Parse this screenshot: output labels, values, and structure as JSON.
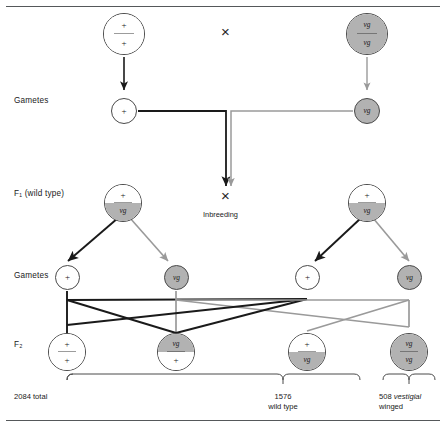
{
  "figure": {
    "title_rules": {
      "top": true,
      "bottom": true
    },
    "colors": {
      "shaded_allele_fill": "#b2b2b2",
      "outline": "#4a4a4a",
      "dominant_line": "#1a1a1a",
      "recessive_line": "#9a9a9a",
      "text": "#1a1a1a"
    }
  },
  "row_labels": {
    "gametes_upper": "Gametes",
    "f1": "F₁ (wild type)",
    "gametes_lower": "Gametes",
    "f2": "F₂"
  },
  "alleles": {
    "wild_type": "+",
    "vestigial": "vg"
  },
  "parents": {
    "cross_symbol": "×",
    "left": {
      "name": "wild-type-parent",
      "top": "+",
      "bottom": "+",
      "top_shaded": false,
      "bottom_shaded": false
    },
    "right": {
      "name": "vestigial-parent",
      "top": "vg",
      "bottom": "vg",
      "top_shaded": true,
      "bottom_shaded": true
    }
  },
  "gametes_upper": [
    {
      "name": "gamete-plus-left",
      "label": "+",
      "shaded": false
    },
    {
      "name": "gamete-vg-right",
      "label": "vg",
      "shaded": true
    }
  ],
  "f1": {
    "cross_symbol": "×",
    "inbreeding_label": "Inbreeding",
    "left": {
      "name": "f1-heterozygote-left",
      "top": "+",
      "bottom": "vg",
      "top_shaded": false,
      "bottom_shaded": true
    },
    "right": {
      "name": "f1-heterozygote-right",
      "top": "+",
      "bottom": "vg",
      "top_shaded": false,
      "bottom_shaded": true
    }
  },
  "gametes_lower": [
    {
      "name": "f1-gamete-plus-left",
      "label": "+",
      "shaded": false
    },
    {
      "name": "f1-gamete-vg-left",
      "label": "vg",
      "shaded": true
    },
    {
      "name": "f1-gamete-plus-right",
      "label": "+",
      "shaded": false
    },
    {
      "name": "f1-gamete-vg-right",
      "label": "vg",
      "shaded": true
    }
  ],
  "f2": [
    {
      "name": "f2-genotype-1",
      "top": "+",
      "bottom": "+",
      "top_shaded": false,
      "bottom_shaded": false
    },
    {
      "name": "f2-genotype-2",
      "top": "vg",
      "bottom": "+",
      "top_shaded": true,
      "bottom_shaded": false
    },
    {
      "name": "f2-genotype-3",
      "top": "+",
      "bottom": "vg",
      "top_shaded": false,
      "bottom_shaded": true
    },
    {
      "name": "f2-genotype-4",
      "top": "vg",
      "bottom": "vg",
      "top_shaded": true,
      "bottom_shaded": true
    }
  ],
  "counts": {
    "total": "2084 total",
    "wild_type_number": "1576",
    "wild_type_text": "wild type",
    "vestigial_number": "508",
    "vestigial_italic": "vestigial",
    "vestigial_text": "winged"
  }
}
